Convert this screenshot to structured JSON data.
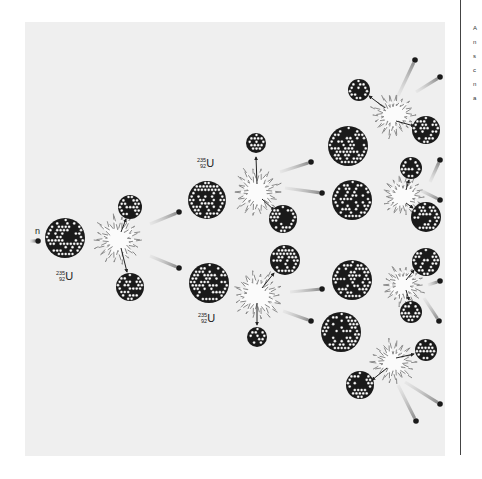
{
  "figure": {
    "background_panel": "#efefef",
    "colors": {
      "nucleus_dark": "#1a1a1a",
      "nucleon_light": "#ffffff",
      "neutron": "#1a1a1a",
      "trail": "#9a9a9a",
      "burst_stroke": "#8a8a8a"
    },
    "labels": {
      "neutron": "n",
      "isotope_mass": "235",
      "isotope_atomic": "92",
      "isotope_symbol": "U"
    },
    "side_text_fragment": "A\nn\ns\nc\nn\na",
    "generations": [
      {
        "generation": 1,
        "fissions": 1,
        "neutrons_released": 2
      },
      {
        "generation": 2,
        "fissions": 2,
        "neutrons_released": 4
      },
      {
        "generation": 3,
        "fissions": 4,
        "neutrons_released": 8
      }
    ],
    "nuclei": [
      {
        "id": "u235-gen1",
        "x": 65,
        "y": 238,
        "r": 20
      },
      {
        "id": "frag-1a",
        "x": 130,
        "y": 207,
        "r": 12
      },
      {
        "id": "frag-1b",
        "x": 130,
        "y": 287,
        "r": 14
      },
      {
        "id": "u235-gen2-top",
        "x": 207,
        "y": 200,
        "r": 19
      },
      {
        "id": "u235-gen2-bottom",
        "x": 209,
        "y": 283,
        "r": 20
      },
      {
        "id": "frag-2a",
        "x": 256,
        "y": 143,
        "r": 10
      },
      {
        "id": "frag-2b",
        "x": 283,
        "y": 219,
        "r": 14
      },
      {
        "id": "frag-2c",
        "x": 285,
        "y": 260,
        "r": 15
      },
      {
        "id": "frag-2d",
        "x": 257,
        "y": 337,
        "r": 10
      },
      {
        "id": "u235-gen3-a",
        "x": 348,
        "y": 146,
        "r": 20
      },
      {
        "id": "u235-gen3-b",
        "x": 352,
        "y": 200,
        "r": 20
      },
      {
        "id": "u235-gen3-c",
        "x": 352,
        "y": 280,
        "r": 20
      },
      {
        "id": "u235-gen3-d",
        "x": 341,
        "y": 332,
        "r": 20
      },
      {
        "id": "frag-3a",
        "x": 359,
        "y": 90,
        "r": 11
      },
      {
        "id": "frag-3b",
        "x": 426,
        "y": 130,
        "r": 14
      },
      {
        "id": "frag-3c",
        "x": 411,
        "y": 168,
        "r": 11
      },
      {
        "id": "frag-3d",
        "x": 426,
        "y": 217,
        "r": 15
      },
      {
        "id": "frag-3e",
        "x": 426,
        "y": 262,
        "r": 14
      },
      {
        "id": "frag-3f",
        "x": 411,
        "y": 312,
        "r": 11
      },
      {
        "id": "frag-3g",
        "x": 426,
        "y": 350,
        "r": 11
      },
      {
        "id": "frag-3h",
        "x": 360,
        "y": 385,
        "r": 14
      }
    ],
    "bursts": [
      {
        "id": "burst-1",
        "x": 118,
        "y": 240,
        "r": 24
      },
      {
        "id": "burst-2a",
        "x": 257,
        "y": 192,
        "r": 24
      },
      {
        "id": "burst-2b",
        "x": 257,
        "y": 295,
        "r": 24
      },
      {
        "id": "burst-3a",
        "x": 393,
        "y": 115,
        "r": 22
      },
      {
        "id": "burst-3b",
        "x": 403,
        "y": 197,
        "r": 20
      },
      {
        "id": "burst-3c",
        "x": 403,
        "y": 285,
        "r": 20
      },
      {
        "id": "burst-3d",
        "x": 393,
        "y": 362,
        "r": 22
      }
    ],
    "neutrons": [
      {
        "id": "n-incoming",
        "x": 38,
        "y": 241,
        "tx": 30,
        "ty": 241
      },
      {
        "id": "n-1a",
        "x": 179,
        "y": 212,
        "tx": 150,
        "ty": 224
      },
      {
        "id": "n-1b",
        "x": 179,
        "y": 268,
        "tx": 150,
        "ty": 256
      },
      {
        "id": "n-2a",
        "x": 311,
        "y": 162,
        "tx": 280,
        "ty": 172
      },
      {
        "id": "n-2b",
        "x": 322,
        "y": 193,
        "tx": 285,
        "ty": 188
      },
      {
        "id": "n-2c",
        "x": 322,
        "y": 289,
        "tx": 290,
        "ty": 292
      },
      {
        "id": "n-2d",
        "x": 311,
        "y": 321,
        "tx": 283,
        "ty": 311
      },
      {
        "id": "n-3a",
        "x": 415,
        "y": 60,
        "tx": 398,
        "ty": 96
      },
      {
        "id": "n-3b",
        "x": 440,
        "y": 77,
        "tx": 416,
        "ty": 92
      },
      {
        "id": "n-3c",
        "x": 440,
        "y": 160,
        "tx": 430,
        "ty": 182
      },
      {
        "id": "n-3d",
        "x": 440,
        "y": 200,
        "tx": 420,
        "ty": 190
      },
      {
        "id": "n-3e",
        "x": 440,
        "y": 281,
        "tx": 428,
        "ty": 285
      },
      {
        "id": "n-3f",
        "x": 439,
        "y": 321,
        "tx": 424,
        "ty": 298
      },
      {
        "id": "n-3g",
        "x": 440,
        "y": 404,
        "tx": 405,
        "ty": 382
      },
      {
        "id": "n-3h",
        "x": 416,
        "y": 421,
        "tx": 398,
        "ty": 385
      }
    ],
    "arrows": [
      {
        "x1": 121,
        "y1": 232,
        "x2": 126,
        "y2": 219
      },
      {
        "x1": 121,
        "y1": 248,
        "x2": 127,
        "y2": 272
      },
      {
        "x1": 257,
        "y1": 184,
        "x2": 256,
        "y2": 157
      },
      {
        "x1": 262,
        "y1": 199,
        "x2": 274,
        "y2": 210
      },
      {
        "x1": 262,
        "y1": 288,
        "x2": 274,
        "y2": 273
      },
      {
        "x1": 257,
        "y1": 303,
        "x2": 257,
        "y2": 325
      },
      {
        "x1": 385,
        "y1": 108,
        "x2": 369,
        "y2": 96
      },
      {
        "x1": 396,
        "y1": 121,
        "x2": 414,
        "y2": 126
      },
      {
        "x1": 406,
        "y1": 190,
        "x2": 409,
        "y2": 180
      },
      {
        "x1": 406,
        "y1": 203,
        "x2": 413,
        "y2": 208
      },
      {
        "x1": 406,
        "y1": 280,
        "x2": 414,
        "y2": 270
      },
      {
        "x1": 406,
        "y1": 290,
        "x2": 409,
        "y2": 300
      },
      {
        "x1": 396,
        "y1": 358,
        "x2": 414,
        "y2": 354
      },
      {
        "x1": 387,
        "y1": 368,
        "x2": 372,
        "y2": 380
      }
    ],
    "isotope_label_positions": [
      {
        "id": "label-gen1",
        "x": 56,
        "y": 270
      },
      {
        "id": "label-gen2-top",
        "x": 197,
        "y": 157
      },
      {
        "id": "label-gen2-bottom",
        "x": 198,
        "y": 312
      }
    ],
    "neutron_label_position": {
      "x": 35,
      "y": 226
    }
  }
}
